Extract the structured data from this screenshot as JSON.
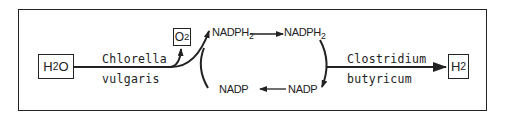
{
  "diagram": {
    "type": "biochemical-pathway",
    "nodes": {
      "water": {
        "base": "H",
        "sub": "2",
        "tail": "O"
      },
      "oxygen": {
        "base": "O",
        "sub": "2"
      },
      "hydrogen": {
        "base": "H",
        "sub": "2"
      },
      "nadph2_left": {
        "base": "NADPH",
        "sub": "2"
      },
      "nadph2_right": {
        "base": "NADPH",
        "sub": "2"
      },
      "nadp_left": {
        "label": "NADP"
      },
      "nadp_right": {
        "label": "NADP"
      }
    },
    "organisms": {
      "first": {
        "line1": "Chlorella",
        "line2": "vulgaris"
      },
      "second": {
        "line1": "Clostridium",
        "line2": "butyricum"
      }
    },
    "edges": [
      {
        "from": "H2O",
        "to": "O2",
        "via": "Chlorella vulgaris"
      },
      {
        "from": "H2O",
        "to": "NADPH2",
        "via": "Chlorella vulgaris"
      },
      {
        "from": "NADPH2",
        "to": "NADPH2"
      },
      {
        "from": "NADPH2",
        "to": "NADP"
      },
      {
        "from": "NADP",
        "to": "NADP"
      },
      {
        "from": "NADPH2",
        "to": "H2",
        "via": "Clostridium butyricum"
      }
    ],
    "colors": {
      "stroke": "#222222",
      "background": "#ffffff"
    }
  }
}
